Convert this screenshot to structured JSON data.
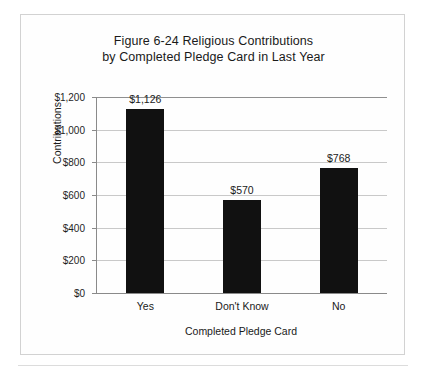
{
  "chart_data": {
    "type": "bar",
    "title": "Figure 6-24 Religious Contributions by Completed Pledge Card in Last Year",
    "title_lines": [
      "Figure 6-24 Religious Contributions",
      "by Completed Pledge Card in Last Year"
    ],
    "categories": [
      "Yes",
      "Don't Know",
      "No"
    ],
    "values": [
      1126,
      570,
      768
    ],
    "value_labels": [
      "$1,126",
      "$570",
      "$768"
    ],
    "xlabel": "Completed Pledge Card",
    "ylabel": "Contributions",
    "ylim": [
      0,
      1200
    ],
    "ytick_values": [
      0,
      200,
      400,
      600,
      800,
      1000,
      1200
    ],
    "ytick_labels": [
      "$0",
      "$200",
      "$400",
      "$600",
      "$800",
      "$1,000",
      "$1,200"
    ],
    "grid": true,
    "legend": null,
    "legend_position": "none",
    "bar_color": "#111111",
    "gridline_color": "#c9c9c9",
    "axis_color": "#8a8a8a",
    "background_color": "#fefefe",
    "frame_color": "#d2d2d2"
  }
}
